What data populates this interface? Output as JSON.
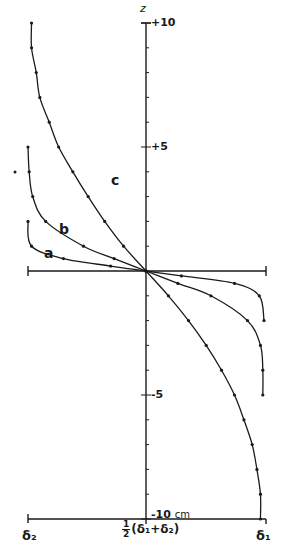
{
  "chart_data": {
    "type": "line",
    "title": "",
    "xlabel": "",
    "ylabel": "z",
    "x_ticks": [
      "δ2",
      "½(δ1+δ2)",
      "δ1"
    ],
    "x_range_normalized": [
      -1,
      1
    ],
    "y_ticks": [
      "+10",
      "+5",
      "-5",
      "-10 cm"
    ],
    "ylim": [
      -10,
      10
    ],
    "y_unit": "cm",
    "grid": false,
    "legend": "inline curve labels",
    "series": [
      {
        "name": "a",
        "points": [
          [
            -1.0,
            2.0
          ],
          [
            -0.97,
            1.0
          ],
          [
            -0.7,
            0.5
          ],
          [
            -0.3,
            0.2
          ],
          [
            0.0,
            0.0
          ],
          [
            0.3,
            -0.2
          ],
          [
            0.75,
            -0.5
          ],
          [
            0.96,
            -1.0
          ],
          [
            1.0,
            -2.0
          ]
        ]
      },
      {
        "name": "b",
        "points": [
          [
            -1.0,
            5.0
          ],
          [
            -0.99,
            4.0
          ],
          [
            -0.96,
            3.0
          ],
          [
            -0.85,
            2.0
          ],
          [
            -0.53,
            1.0
          ],
          [
            -0.27,
            0.5
          ],
          [
            0.0,
            0.0
          ],
          [
            0.27,
            -0.5
          ],
          [
            0.55,
            -1.0
          ],
          [
            0.86,
            -2.0
          ],
          [
            0.97,
            -3.0
          ],
          [
            0.99,
            -4.0
          ],
          [
            0.99,
            -5.0
          ]
        ]
      },
      {
        "name": "c",
        "points": [
          [
            -0.97,
            10.0
          ],
          [
            -0.97,
            9.0
          ],
          [
            -0.93,
            8.0
          ],
          [
            -0.9,
            7.0
          ],
          [
            -0.82,
            6.0
          ],
          [
            -0.74,
            5.0
          ],
          [
            -0.62,
            4.0
          ],
          [
            -0.49,
            3.0
          ],
          [
            -0.35,
            2.0
          ],
          [
            -0.19,
            1.0
          ],
          [
            0.0,
            0.0
          ],
          [
            0.19,
            -1.0
          ],
          [
            0.36,
            -2.0
          ],
          [
            0.51,
            -3.0
          ],
          [
            0.64,
            -4.0
          ],
          [
            0.75,
            -5.0
          ],
          [
            0.83,
            -6.0
          ],
          [
            0.9,
            -7.0
          ],
          [
            0.94,
            -8.0
          ],
          [
            0.97,
            -9.0
          ],
          [
            0.97,
            -10.0
          ]
        ]
      }
    ]
  },
  "labels": {
    "z_axis": "z",
    "tick_p10": "+10",
    "tick_p5": "+5",
    "tick_m5": "-5",
    "tick_m10": "-10",
    "tick_m10_unit": "cm",
    "x_left": "δ₂",
    "x_right": "δ₁",
    "x_mid_num": "1",
    "x_mid_den": "2",
    "x_mid_expr": "(δ₁+δ₂)",
    "curve_a": "a",
    "curve_b": "b",
    "curve_c": "c"
  },
  "colors": {
    "ink": "#1a1a1a",
    "background": "#ffffff"
  }
}
